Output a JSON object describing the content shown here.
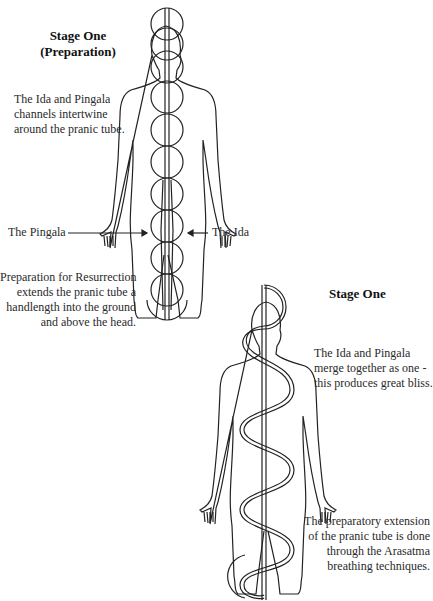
{
  "stage1_prep": {
    "title_line1": "Stage One",
    "title_line2": "(Preparation)",
    "desc": [
      "The Ida and Pingala",
      "channels intertwine",
      "around the pranic tube."
    ],
    "label_pingala": "The Pingala",
    "label_ida": "The Ida",
    "note": [
      "Preparation for Resurrection",
      "extends the pranic tube a",
      "handlength into the ground",
      "and above the head."
    ]
  },
  "stage1": {
    "title": "Stage One",
    "desc": [
      "The Ida and Pingala",
      "merge together as one -",
      "this produces great bliss."
    ],
    "note": [
      "The preparatory extension",
      "of the pranic tube is done",
      "through the Arasatma",
      "breathing techniques."
    ]
  },
  "colors": {
    "line": "#222222",
    "background": "#ffffff"
  }
}
